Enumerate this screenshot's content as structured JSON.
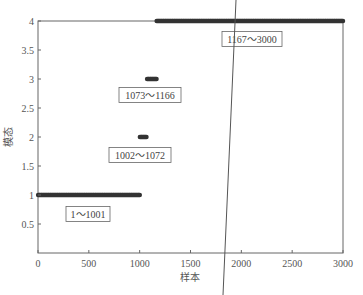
{
  "chart_data": {
    "type": "scatter",
    "title": "",
    "xlabel": "样本",
    "ylabel": "模态",
    "xlim": [
      0,
      3000
    ],
    "ylim": [
      0,
      4
    ],
    "xticks": [
      0,
      500,
      1000,
      1500,
      2000,
      2500,
      3000
    ],
    "xtick_labels": [
      "0",
      "500",
      "1000",
      "1500",
      "2000",
      "2500",
      "3000"
    ],
    "yticks": [
      0.5,
      1,
      1.5,
      2,
      2.5,
      3,
      3.5,
      4
    ],
    "ytick_labels": [
      "0.5",
      "1",
      "1.5",
      "2",
      "2.5",
      "3",
      "3.5",
      "4"
    ],
    "grid": false,
    "legend": null,
    "series": [
      {
        "name": "模态1",
        "x_range": [
          1,
          1001
        ],
        "y": 1,
        "marker": "*"
      },
      {
        "name": "模态2",
        "x_range": [
          1002,
          1072
        ],
        "y": 2,
        "marker": "*"
      },
      {
        "name": "模态3",
        "x_range": [
          1073,
          1166
        ],
        "y": 3,
        "marker": "*"
      },
      {
        "name": "模态4",
        "x_range": [
          1167,
          3000
        ],
        "y": 4,
        "marker": "*"
      }
    ],
    "annotations": [
      {
        "text": "1～1001",
        "x": 300,
        "y": 0.78
      },
      {
        "text": "1002～1072",
        "x": 1000,
        "y": 1.63
      },
      {
        "text": "1073～1166",
        "x": 1100,
        "y": 2.72
      },
      {
        "text": "1167～3000",
        "x": 1800,
        "y": 3.74
      }
    ],
    "overlay_line": {
      "description": "slanted vertical line crossing chart near x≈1900",
      "from_px": [
        236,
        0
      ],
      "to_px": [
        223,
        295
      ]
    }
  },
  "colors": {
    "marker": "#333333",
    "axis": "#666666",
    "text": "#555555"
  }
}
